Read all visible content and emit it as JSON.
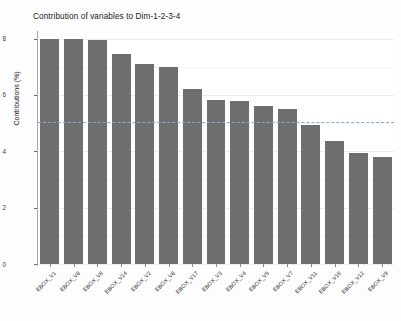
{
  "chart_data": {
    "type": "bar",
    "title": "Contribution of variables to Dim-1-2-3-4",
    "xlabel": "",
    "ylabel": "Contributions (%)",
    "ylim": [
      0,
      8.2
    ],
    "yticks": [
      0,
      2,
      4,
      6,
      8
    ],
    "ytick_labels": [
      "0",
      "2",
      "4",
      "6",
      "8"
    ],
    "grid": true,
    "legend": "none",
    "bar_color": "#6e6e6e",
    "reference_line": {
      "value": 5.05,
      "style": "dashed",
      "color": "#8ea9c9",
      "label": ""
    },
    "categories": [
      "EBOX_V1",
      "EBOX_V6",
      "EBOX_V8",
      "EBOX_V14",
      "EBOX_V2",
      "EBOX_V6",
      "EBOX_V17",
      "EBOX_V3",
      "EBOX_V4",
      "EBOX_V5",
      "EBOX_V7",
      "EBOX_V11",
      "EBOX_V18",
      "EBOX_V12",
      "EBOX_V9"
    ],
    "values": [
      8.0,
      7.98,
      7.95,
      7.45,
      7.1,
      7.0,
      6.2,
      5.82,
      5.8,
      5.6,
      5.5,
      4.95,
      4.35,
      3.95,
      3.8
    ]
  }
}
